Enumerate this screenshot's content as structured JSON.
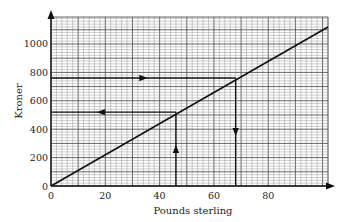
{
  "chart_data": {
    "type": "line",
    "title": "",
    "xlabel": "Pounds sterling",
    "ylabel": "Kroner",
    "xlim": [
      0,
      102
    ],
    "ylim": [
      0,
      1190
    ],
    "grid": true,
    "x_ticks": [
      0,
      20,
      40,
      60,
      80
    ],
    "y_ticks": [
      0,
      200,
      400,
      600,
      800,
      1000
    ],
    "series": [
      {
        "name": "conversion",
        "x": [
          0,
          102
        ],
        "y": [
          0,
          1120
        ]
      }
    ],
    "annotations": [
      {
        "type": "horizontal-arrow",
        "y": 760,
        "from_x": 0,
        "to_x": 68,
        "direction": "right"
      },
      {
        "type": "vertical-arrow",
        "x": 68,
        "from_y": 760,
        "to_y": 0,
        "direction": "down"
      },
      {
        "type": "vertical-arrow",
        "x": 46,
        "from_y": 0,
        "to_y": 520,
        "direction": "up"
      },
      {
        "type": "horizontal-arrow",
        "y": 520,
        "from_x": 46,
        "to_x": 0,
        "direction": "left"
      }
    ],
    "legend": "none"
  },
  "labels": {
    "xlabel": "Pounds sterling",
    "ylabel": "Kroner",
    "x_ticks": [
      "0",
      "20",
      "40",
      "60",
      "80"
    ],
    "y_ticks": [
      "0",
      "200",
      "400",
      "600",
      "800",
      "1000"
    ]
  }
}
